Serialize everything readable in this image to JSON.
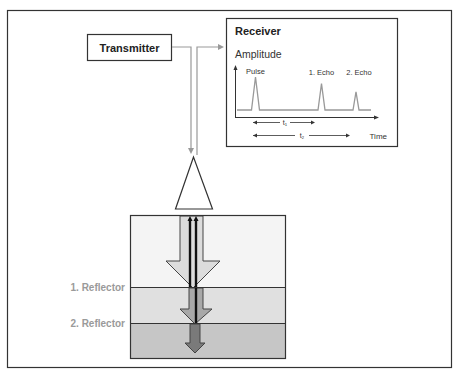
{
  "diagram": {
    "transmitter": {
      "label": "Transmitter"
    },
    "receiver": {
      "title": "Receiver",
      "y_axis_label": "Amplitude",
      "x_axis_label": "Time",
      "peaks": [
        {
          "label": "Pulse",
          "relative_amplitude": 1.0
        },
        {
          "label": "1. Echo",
          "relative_amplitude": 0.8
        },
        {
          "label": "2. Echo",
          "relative_amplitude": 0.55
        }
      ],
      "intervals": [
        {
          "label": "t₁"
        },
        {
          "label": "t₂"
        }
      ]
    },
    "reflectors": [
      {
        "label": "1. Reflector"
      },
      {
        "label": "2. Reflector"
      }
    ],
    "layers": [
      {
        "name": "layer-1",
        "color": "#f4f4f4"
      },
      {
        "name": "layer-2",
        "color": "#e0e0e0"
      },
      {
        "name": "layer-3",
        "color": "#c6c6c6"
      }
    ],
    "colors": {
      "line": "#333333",
      "signal_line": "#999999",
      "reflector_label": "#9a9a9a",
      "arrow_light": "#dcdcdc",
      "arrow_mid": "#a8a8a8",
      "arrow_dark": "#7a7a7a"
    }
  }
}
